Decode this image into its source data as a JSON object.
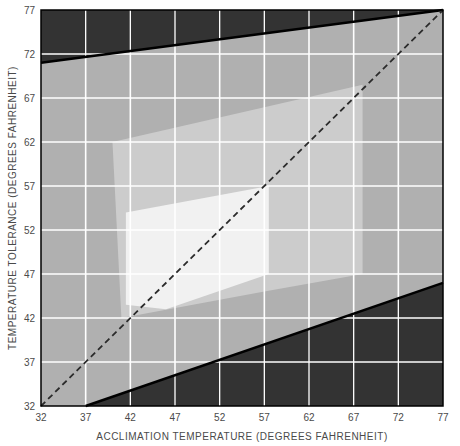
{
  "chart_data": {
    "type": "area",
    "title": "",
    "xlabel": "ACCLIMATION TEMPERATURE (DEGREES FAHRENHEIT)",
    "ylabel": "TEMPERATURE TOLERANCE (DEGREES FAHRENHEIT)",
    "xlim": [
      32,
      77
    ],
    "ylim": [
      32,
      77
    ],
    "xticks": [
      32,
      37,
      42,
      47,
      52,
      57,
      62,
      67,
      72,
      77
    ],
    "yticks": [
      32,
      37,
      42,
      47,
      52,
      57,
      62,
      67,
      72,
      77
    ],
    "xtick_labels": [
      "32",
      "37",
      "42",
      "47",
      "52",
      "57",
      "62",
      "67",
      "72",
      "77"
    ],
    "ytick_labels": [
      "32",
      "37",
      "42",
      "47",
      "52",
      "57",
      "62",
      "67",
      "72",
      "77"
    ],
    "grid": true,
    "grid_color": "#ffffff",
    "legend_position": "none",
    "background_color": "#333333",
    "series": [
      {
        "name": "Outer tolerance zone",
        "fill_color": "#b0b0b0",
        "note": "Full tolerance polygon bounded by upper incipient-lethal line and lower incipient-lethal line",
        "points": [
          {
            "x": 32,
            "y": 32
          },
          {
            "x": 32,
            "y": 71
          },
          {
            "x": 77,
            "y": 77
          },
          {
            "x": 77,
            "y": 46
          },
          {
            "x": 60,
            "y": 40
          },
          {
            "x": 37,
            "y": 32
          }
        ]
      },
      {
        "name": "Middle zone of thermal tolerance",
        "fill_color": "#cccccc",
        "points": [
          {
            "x": 40,
            "y": 62
          },
          {
            "x": 68,
            "y": 68.5
          },
          {
            "x": 68,
            "y": 47
          },
          {
            "x": 57,
            "y": 45
          },
          {
            "x": 41,
            "y": 42
          },
          {
            "x": 40,
            "y": 62
          }
        ]
      },
      {
        "name": "Inner zone of thermal preference",
        "fill_color": "#f1f1f1",
        "points": [
          {
            "x": 41.5,
            "y": 54
          },
          {
            "x": 57.5,
            "y": 57
          },
          {
            "x": 57.5,
            "y": 47
          },
          {
            "x": 46,
            "y": 43
          },
          {
            "x": 41.5,
            "y": 43.5
          },
          {
            "x": 41.5,
            "y": 54
          }
        ]
      }
    ],
    "reference_line": {
      "name": "equality-line",
      "style": "dashed",
      "color": "#2b2b2b",
      "from": {
        "x": 32,
        "y": 32
      },
      "to": {
        "x": 77,
        "y": 77
      }
    },
    "boundary_lines": [
      {
        "name": "upper-lethal-boundary",
        "color": "#000000",
        "from": {
          "x": 32,
          "y": 71
        },
        "to": {
          "x": 77,
          "y": 77
        }
      },
      {
        "name": "lower-lethal-boundary",
        "color": "#000000",
        "from": {
          "x": 37,
          "y": 32
        },
        "to": {
          "x": 77,
          "y": 46
        }
      }
    ]
  },
  "axes": {
    "x_title": "ACCLIMATION TEMPERATURE (DEGREES FAHRENHEIT)",
    "y_title": "TEMPERATURE TOLERANCE (DEGREES FAHRENHEIT)",
    "x_ticks": [
      "32",
      "37",
      "42",
      "47",
      "52",
      "57",
      "62",
      "67",
      "72",
      "77"
    ],
    "y_ticks": [
      "32",
      "37",
      "42",
      "47",
      "52",
      "57",
      "62",
      "67",
      "72",
      "77"
    ]
  },
  "colors": {
    "background_dark": "#333333",
    "zone_outer": "#b0b0b0",
    "zone_middle": "#cccccc",
    "zone_inner": "#f1f1f1",
    "grid": "#ffffff",
    "text": "#4a4a4a",
    "line": "#000000"
  }
}
